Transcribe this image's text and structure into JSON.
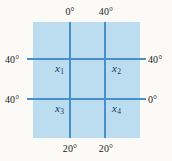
{
  "figure": {
    "type": "finite-difference-grid-diagram",
    "plate_color": "#bcdcf0",
    "grid_line_color": "#4a90c8",
    "node_label_color": "#173a66",
    "background_color": "#fbfaf7"
  },
  "boundary_labels": {
    "top": [
      {
        "text": "0°",
        "at_x_px": 70
      },
      {
        "text": "40°",
        "at_x_px": 105
      }
    ],
    "left": [
      {
        "text": "40°",
        "at_y_px": 59
      },
      {
        "text": "40°",
        "at_y_px": 99
      }
    ],
    "right": [
      {
        "text": "40°",
        "at_y_px": 59
      },
      {
        "text": "0°",
        "at_y_px": 99
      }
    ],
    "bottom": [
      {
        "text": "20°",
        "at_x_px": 70
      },
      {
        "text": "20°",
        "at_x_px": 105
      }
    ]
  },
  "nodes": [
    {
      "symbol": "x",
      "subscript": "1",
      "position": "upper-left"
    },
    {
      "symbol": "x",
      "subscript": "2",
      "position": "upper-right"
    },
    {
      "symbol": "x",
      "subscript": "3",
      "position": "lower-left"
    },
    {
      "symbol": "x",
      "subscript": "4",
      "position": "lower-right"
    }
  ],
  "grid": {
    "vertical_lines_x": [
      70,
      105
    ],
    "horizontal_lines_y": [
      59,
      99
    ]
  }
}
